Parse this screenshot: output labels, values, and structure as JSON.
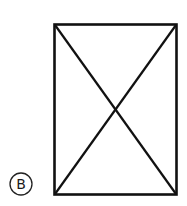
{
  "figure": {
    "option_label": "B",
    "shape": "rectangle-with-diagonals",
    "stroke_color": "#111111",
    "background_color": "#ffffff"
  }
}
